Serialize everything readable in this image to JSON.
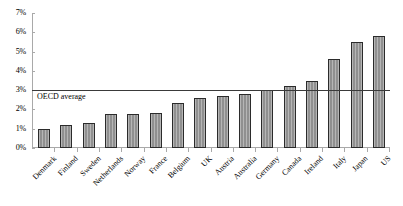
{
  "chart_data": {
    "type": "bar",
    "title": "",
    "subtitle": "",
    "xlabel": "",
    "ylabel": "",
    "ylim": [
      0,
      7
    ],
    "ytick_labels": [
      "0%",
      "1%",
      "2%",
      "3%",
      "4%",
      "5%",
      "6%",
      "7%"
    ],
    "ytick_values": [
      0,
      1,
      2,
      3,
      4,
      5,
      6,
      7
    ],
    "grid": false,
    "legend": null,
    "categories": [
      "Denmark",
      "Finland",
      "Sweden",
      "Netherlands",
      "Norway",
      "France",
      "Belgium",
      "UK",
      "Austria",
      "Australia",
      "Germany",
      "Canada",
      "Ireland",
      "Italy",
      "Japan",
      "US"
    ],
    "values": [
      1.0,
      1.2,
      1.3,
      1.75,
      1.75,
      1.8,
      2.35,
      2.6,
      2.7,
      2.8,
      3.0,
      3.2,
      3.5,
      4.6,
      5.5,
      5.8
    ],
    "annotations": [
      {
        "name": "oecd-average-line",
        "label": "OECD average",
        "value": 3.0,
        "orientation": "horizontal",
        "color": "#3a3a3a"
      }
    ],
    "bar_color": "#969696",
    "bar_border_color": "#2b2b2b",
    "axis_color": "#a9a9a9"
  }
}
